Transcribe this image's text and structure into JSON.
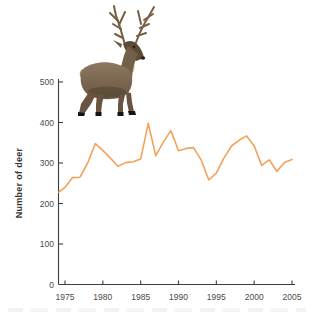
{
  "figure": {
    "ylabel": "Number of deer",
    "deer_alt": "red-deer-stag-photo"
  },
  "palette": {
    "line": "#f2a25b",
    "axis": "#3c3c3c",
    "tick_label": "#4a4a4a",
    "background": "#ffffff"
  },
  "chart_data": {
    "type": "line",
    "title": "",
    "xlabel": "",
    "ylabel": "Number of deer",
    "series": [
      {
        "name": "Number of deer",
        "x": [
          1974,
          1975,
          1976,
          1977,
          1978,
          1979,
          1980,
          1981,
          1982,
          1983,
          1984,
          1985,
          1986,
          1987,
          1988,
          1989,
          1990,
          1991,
          1992,
          1993,
          1994,
          1995,
          1996,
          1997,
          1998,
          1999,
          2000,
          2001,
          2002,
          2003,
          2004,
          2005
        ],
        "values": [
          228,
          240,
          264,
          265,
          300,
          348,
          331,
          312,
          292,
          301,
          303,
          310,
          398,
          318,
          352,
          380,
          330,
          336,
          338,
          307,
          258,
          275,
          312,
          342,
          356,
          367,
          342,
          294,
          308,
          279,
          301,
          309
        ]
      }
    ],
    "xticks": [
      1975,
      1980,
      1985,
      1990,
      1995,
      2000,
      2005
    ],
    "yticks": [
      0,
      100,
      200,
      300,
      400,
      500
    ],
    "xlim": [
      1974,
      2005.5
    ],
    "ylim": [
      0,
      500
    ],
    "grid": false,
    "legend": "none",
    "line_color": "#f2a25b"
  }
}
